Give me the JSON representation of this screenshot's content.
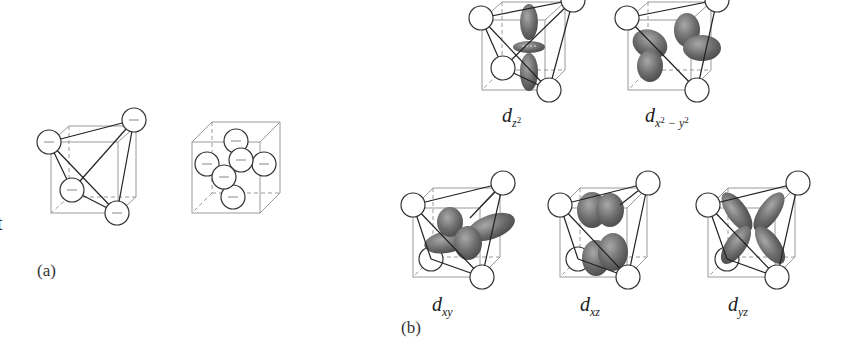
{
  "figure": {
    "edge_text": "t",
    "panel_a": {
      "label": "(a)",
      "left_cube": "tetrahedral arrangement of four negative charges",
      "right_cube": "octahedral arrangement of six negative charges",
      "charge_symbol": "−"
    },
    "panel_b": {
      "label": "(b)",
      "orbitals": [
        {
          "id": "dz2",
          "base": "d",
          "sub": "z",
          "sup": "2"
        },
        {
          "id": "dx2-y2",
          "base": "d",
          "sub": "x",
          "sup": "2",
          "sub2": "− y",
          "sup2": "2"
        },
        {
          "id": "dxy",
          "base": "d",
          "sub": "xy"
        },
        {
          "id": "dxz",
          "base": "d",
          "sub": "xz"
        },
        {
          "id": "dyz",
          "base": "d",
          "sub": "yz"
        }
      ]
    },
    "colors": {
      "lobe": "#6e6e6e",
      "cube": "#9a9a9a",
      "bond": "#222222"
    }
  }
}
